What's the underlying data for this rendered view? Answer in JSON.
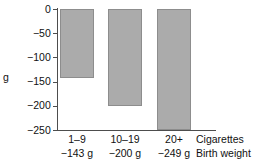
{
  "chart_data": {
    "type": "bar",
    "title": "",
    "subtitle": "",
    "xlabel": "Cigarettes",
    "ylabel": "g",
    "categories": [
      "1–9",
      "10–19",
      "20+"
    ],
    "values": [
      -143,
      -200,
      -249
    ],
    "value_labels": [
      "−143 g",
      "−200 g",
      "−249 g"
    ],
    "ylim": [
      -250,
      0
    ],
    "yticks": [
      0,
      -50,
      -100,
      -150,
      -200,
      -250
    ],
    "ytick_labels": [
      "0",
      "−50",
      "−100",
      "−150",
      "−200",
      "−250"
    ],
    "grid": false,
    "legend": null,
    "row_labels": {
      "categories_row": "Cigarettes",
      "values_row": "Birth weight"
    },
    "colors": {
      "bar_fill": "#ababab",
      "bar_stroke": "#8d8d8d",
      "axis": "#4d4d4d",
      "text": "#111111",
      "background": "#ffffff"
    }
  }
}
